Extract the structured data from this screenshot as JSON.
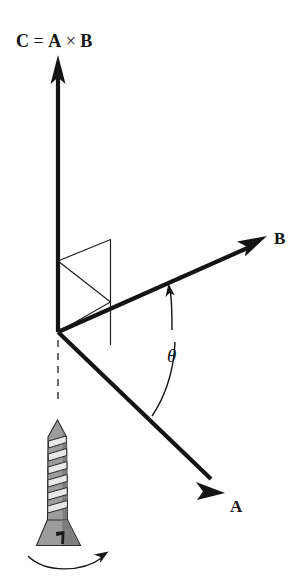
{
  "figure": {
    "title_equation": {
      "c_symbol": "C",
      "equals": "=",
      "a_symbol": "A",
      "cross": "×",
      "b_symbol": "B",
      "full_text": "C = A × B"
    },
    "labels": {
      "vector_c": "C = A × B",
      "vector_b": "B",
      "vector_a": "A",
      "angle_theta": "θ"
    },
    "icons": {
      "screw": "screw-icon",
      "rotation_arrow": "curved-rotation-arrow-icon",
      "arrowhead_c": "arrowhead-up-icon",
      "arrowhead_b": "arrowhead-upright-icon",
      "arrowhead_a": "arrowhead-downright-icon",
      "arrowhead_theta": "arrowhead-small-icon"
    },
    "colors": {
      "ink": "#141414",
      "background": "#ffffff",
      "screw_metal": "#9c9c9c",
      "screw_thread": "#e8e8e8",
      "screw_shadow": "#7e7e7e"
    },
    "geometry": {
      "origin": [
        58,
        332
      ],
      "vector_c_tip": [
        58,
        57
      ],
      "vector_b_tip": [
        265,
        237
      ],
      "vector_a_tip": [
        224,
        492
      ],
      "parallelogram": [
        [
          58,
          261
        ],
        [
          110,
          240
        ],
        [
          110,
          302
        ],
        [
          58,
          332
        ]
      ]
    }
  }
}
